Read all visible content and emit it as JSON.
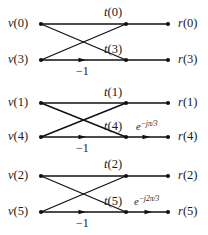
{
  "figure": {
    "kind": "signal-flow-graph",
    "width": 208,
    "height": 235,
    "line_color": "#111111",
    "text_color": "#1a1a1a",
    "background": "#ffffff"
  },
  "columns": {
    "input_x": 41,
    "middle_x": 126,
    "output_x": 168
  },
  "groups": [
    {
      "id": "group-0",
      "top_y": 24,
      "bottom_y": 60,
      "inputs": [
        {
          "name": "v(0)",
          "var": "v",
          "index": "(0)",
          "x": 41,
          "y": 24,
          "label_x": 8,
          "label_y": 17
        },
        {
          "name": "v(3)",
          "var": "v",
          "index": "(3)",
          "x": 41,
          "y": 60,
          "label_x": 8,
          "label_y": 53
        }
      ],
      "middles": [
        {
          "name": "t(0)",
          "var": "t",
          "index": "(0)",
          "x": 126,
          "y": 24,
          "label_x": 104,
          "label_y": 6
        },
        {
          "name": "t(3)",
          "var": "t",
          "index": "(3)",
          "x": 126,
          "y": 60,
          "label_x": 104,
          "label_y": 43
        }
      ],
      "outputs": [
        {
          "name": "r(0)",
          "var": "r",
          "index": "(0)",
          "x": 168,
          "y": 24,
          "label_x": 178,
          "label_y": 17
        },
        {
          "name": "r(3)",
          "var": "r",
          "index": "(3)",
          "x": 168,
          "y": 60,
          "label_x": 178,
          "label_y": 53
        }
      ],
      "gain_label": "−1",
      "gain_label_x": 76,
      "gain_label_y": 65,
      "gain_arrow_x": 86,
      "gain_arrow_y": 60,
      "twiddle": null,
      "twiddle_arrow": false
    },
    {
      "id": "group-1",
      "top_y": 103,
      "bottom_y": 137,
      "inputs": [
        {
          "name": "v(1)",
          "var": "v",
          "index": "(1)",
          "x": 41,
          "y": 103,
          "label_x": 8,
          "label_y": 96
        },
        {
          "name": "v(4)",
          "var": "v",
          "index": "(4)",
          "x": 41,
          "y": 137,
          "label_x": 8,
          "label_y": 130
        }
      ],
      "middles": [
        {
          "name": "t(1)",
          "var": "t",
          "index": "(1)",
          "x": 126,
          "y": 103,
          "label_x": 104,
          "label_y": 86
        },
        {
          "name": "t(4)",
          "var": "t",
          "index": "(4)",
          "x": 126,
          "y": 137,
          "label_x": 104,
          "label_y": 120
        }
      ],
      "outputs": [
        {
          "name": "r(1)",
          "var": "r",
          "index": "(1)",
          "x": 168,
          "y": 103,
          "label_x": 178,
          "label_y": 96
        },
        {
          "name": "r(4)",
          "var": "r",
          "index": "(4)",
          "x": 168,
          "y": 137,
          "label_x": 178,
          "label_y": 130
        }
      ],
      "gain_label": "−1",
      "gain_label_x": 76,
      "gain_label_y": 142,
      "gain_arrow_x": 86,
      "gain_arrow_y": 137,
      "twiddle": {
        "base": "e",
        "exponent": "−jπ/3",
        "x": 136,
        "y": 122
      },
      "twiddle_arrow": true,
      "twiddle_arrow_x": 150,
      "twiddle_arrow_y": 137
    },
    {
      "id": "group-2",
      "top_y": 176,
      "bottom_y": 212,
      "inputs": [
        {
          "name": "v(2)",
          "var": "v",
          "index": "(2)",
          "x": 41,
          "y": 176,
          "label_x": 8,
          "label_y": 169
        },
        {
          "name": "v(5)",
          "var": "v",
          "index": "(5)",
          "x": 41,
          "y": 212,
          "label_x": 8,
          "label_y": 205
        }
      ],
      "middles": [
        {
          "name": "t(2)",
          "var": "t",
          "index": "(2)",
          "x": 126,
          "y": 176,
          "label_x": 104,
          "label_y": 158
        },
        {
          "name": "t(5)",
          "var": "t",
          "index": "(5)",
          "x": 126,
          "y": 212,
          "label_x": 104,
          "label_y": 195
        }
      ],
      "outputs": [
        {
          "name": "r(2)",
          "var": "r",
          "index": "(2)",
          "x": 168,
          "y": 176,
          "label_x": 178,
          "label_y": 169
        },
        {
          "name": "r(5)",
          "var": "r",
          "index": "(5)",
          "x": 168,
          "y": 212,
          "label_x": 178,
          "label_y": 205
        }
      ],
      "gain_label": "−1",
      "gain_label_x": 76,
      "gain_label_y": 217,
      "gain_arrow_x": 86,
      "gain_arrow_y": 212,
      "twiddle": {
        "base": "e",
        "exponent": "−j2π/3",
        "x": 134,
        "y": 197
      },
      "twiddle_arrow": true,
      "twiddle_arrow_x": 152,
      "twiddle_arrow_y": 212
    }
  ]
}
